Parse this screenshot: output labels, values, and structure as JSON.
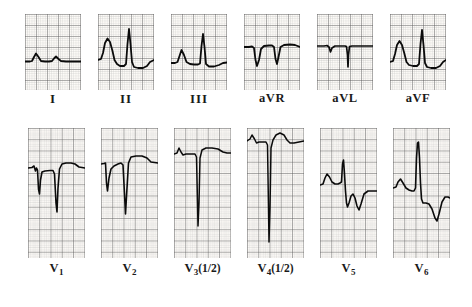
{
  "figure": {
    "kind": "12-lead electrocardiogram",
    "background_color": "#ffffff",
    "trace_color": "#101010",
    "grid_major_color": "#6b6b6b",
    "grid_minor_color": "#b8b8b8",
    "rows": 2,
    "columns": 6
  },
  "leads": [
    {
      "id": "I",
      "label_main": "I",
      "label_sub": "",
      "label_suffix": "",
      "row": 0,
      "col": 0,
      "x": 25,
      "y": 14,
      "w": 56,
      "h": 76,
      "baseline_pct": 62,
      "calibration": "full",
      "description": "low voltage, small upright R waves, flat baseline"
    },
    {
      "id": "II",
      "label_main": "II",
      "label_sub": "",
      "label_suffix": "",
      "row": 0,
      "col": 1,
      "x": 98,
      "y": 14,
      "w": 56,
      "h": 76,
      "baseline_pct": 62,
      "calibration": "full",
      "description": "tall upright R waves, depressed ST segment"
    },
    {
      "id": "III",
      "label_main": "III",
      "label_sub": "",
      "label_suffix": "",
      "row": 0,
      "col": 2,
      "x": 171,
      "y": 14,
      "w": 56,
      "h": 76,
      "baseline_pct": 63,
      "calibration": "full",
      "description": "upright R waves with rounded preceding deflection"
    },
    {
      "id": "aVR",
      "label_main": "aVR",
      "label_sub": "",
      "label_suffix": "",
      "row": 0,
      "col": 3,
      "x": 244,
      "y": 14,
      "w": 56,
      "h": 76,
      "baseline_pct": 46,
      "calibration": "full",
      "description": "predominantly negative QS complexes"
    },
    {
      "id": "aVL",
      "label_main": "aVL",
      "label_sub": "",
      "label_suffix": "",
      "row": 0,
      "col": 4,
      "x": 317,
      "y": 14,
      "w": 56,
      "h": 76,
      "baseline_pct": 44,
      "calibration": "full",
      "description": "very low voltage, narrow downward spike"
    },
    {
      "id": "aVF",
      "label_main": "aVF",
      "label_sub": "",
      "label_suffix": "",
      "row": 0,
      "col": 5,
      "x": 390,
      "y": 14,
      "w": 56,
      "h": 76,
      "baseline_pct": 62,
      "calibration": "full",
      "description": "tall upright R waves, depressed ST segment"
    },
    {
      "id": "V1",
      "label_main": "V",
      "label_sub": "1",
      "label_suffix": "",
      "row": 1,
      "col": 0,
      "x": 28,
      "y": 128,
      "w": 57,
      "h": 130,
      "baseline_pct": 31,
      "calibration": "full",
      "description": "deep QS complexes, no R wave progression"
    },
    {
      "id": "V2",
      "label_main": "V",
      "label_sub": "2",
      "label_suffix": "",
      "row": 1,
      "col": 1,
      "x": 101,
      "y": 128,
      "w": 57,
      "h": 130,
      "baseline_pct": 28,
      "calibration": "full",
      "description": "deep QS complexes, elevated ST takeoff"
    },
    {
      "id": "V3",
      "label_main": "V",
      "label_sub": "3",
      "label_suffix": "(1/2)",
      "row": 1,
      "col": 2,
      "x": 174,
      "y": 128,
      "w": 57,
      "h": 130,
      "baseline_pct": 20,
      "calibration": "half",
      "description": "very deep QS complex recorded at half standardization"
    },
    {
      "id": "V4",
      "label_main": "V",
      "label_sub": "4",
      "label_suffix": "(1/2)",
      "row": 1,
      "col": 3,
      "x": 247,
      "y": 128,
      "w": 57,
      "h": 130,
      "baseline_pct": 12,
      "calibration": "half",
      "description": "very deep QS complex recorded at half standardization"
    },
    {
      "id": "V5",
      "label_main": "V",
      "label_sub": "5",
      "label_suffix": "",
      "row": 1,
      "col": 4,
      "x": 320,
      "y": 128,
      "w": 57,
      "h": 130,
      "baseline_pct": 40,
      "calibration": "full",
      "description": "rS pattern with deep S wave and inverted T wave"
    },
    {
      "id": "V6",
      "label_main": "V",
      "label_sub": "6",
      "label_suffix": "",
      "row": 1,
      "col": 5,
      "x": 393,
      "y": 128,
      "w": 57,
      "h": 130,
      "baseline_pct": 44,
      "calibration": "full",
      "description": "tall R wave with deep inverted T wave"
    }
  ],
  "labels": {
    "row_limb": [
      "I",
      "II",
      "III",
      "aVR",
      "aVL",
      "aVF"
    ],
    "row_chest": [
      "V1",
      "V2",
      "V3 (1/2)",
      "V4(1/2)",
      "V5",
      "V6"
    ]
  }
}
